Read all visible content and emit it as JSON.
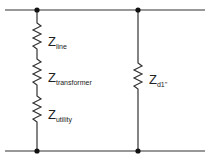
{
  "diagram": {
    "type": "circuit-schematic",
    "left_branch": {
      "elements": [
        {
          "symbol": "Z",
          "subscript": "line"
        },
        {
          "symbol": "Z",
          "subscript": "transformer"
        },
        {
          "symbol": "Z",
          "subscript": "utility"
        }
      ]
    },
    "right_branch": {
      "elements": [
        {
          "symbol": "Z",
          "subscript": "d1''"
        }
      ]
    },
    "colors": {
      "wire": "#333333",
      "text": "#222222"
    }
  }
}
